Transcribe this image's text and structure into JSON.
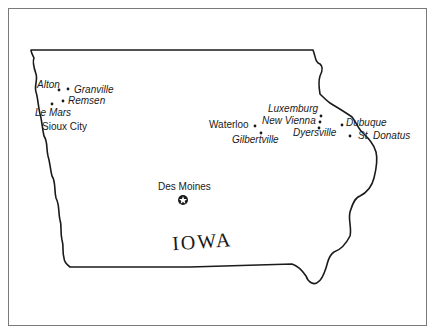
{
  "map": {
    "title": "IOWA",
    "capital": {
      "name": "Des Moines",
      "icon": "star-in-circle-icon"
    },
    "towns": [
      {
        "name": "Alton",
        "italic": true
      },
      {
        "name": "Granville",
        "italic": true
      },
      {
        "name": "Remsen",
        "italic": true
      },
      {
        "name": "Le Mars",
        "italic": true
      },
      {
        "name": "Sioux City",
        "italic": false
      },
      {
        "name": "Waterloo",
        "italic": false
      },
      {
        "name": "Gilbertville",
        "italic": true
      },
      {
        "name": "Luxemburg",
        "italic": true
      },
      {
        "name": "New Vienna",
        "italic": true
      },
      {
        "name": "Dyersville",
        "italic": true
      },
      {
        "name": "Dubuque",
        "italic": true
      },
      {
        "name": "St. Donatus",
        "italic": true
      }
    ],
    "colors": {
      "outline": "#1a1a1a",
      "frame": "#7a7a7a",
      "background": "#ffffff"
    }
  }
}
